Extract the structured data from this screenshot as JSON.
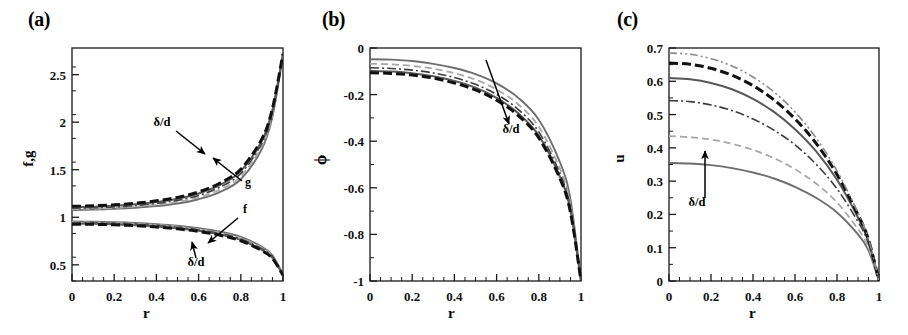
{
  "figure": {
    "panels": [
      {
        "tag": "(a)",
        "xlabel": "r",
        "ylabel": "f,g",
        "annotations": [
          "δ/d",
          "g",
          "f",
          "δ/d"
        ]
      },
      {
        "tag": "(b)",
        "xlabel": "r",
        "ylabel": "ϕ",
        "annotations": [
          "δ/d"
        ]
      },
      {
        "tag": "(c)",
        "xlabel": "r",
        "ylabel": "u",
        "annotations": [
          "δ/d"
        ]
      }
    ]
  },
  "chart_data": [
    {
      "type": "line",
      "panel": "(a)",
      "title": "",
      "xlabel": "r",
      "ylabel": "f,g",
      "xlim": [
        0,
        1
      ],
      "ylim": [
        0.33,
        2.78
      ],
      "xticks": [
        0,
        0.2,
        0.4,
        0.6,
        0.8,
        1
      ],
      "xticklabels": [
        "0",
        "0.2",
        "0.4",
        "0.6",
        "0.8",
        "1"
      ],
      "yticks": [
        0.5,
        1,
        1.5,
        2,
        2.5
      ],
      "yticklabels": [
        "0.5",
        "1",
        "1.5",
        "2",
        "2.5"
      ],
      "grid": false,
      "legend": "none",
      "x": [
        0,
        0.1,
        0.2,
        0.3,
        0.4,
        0.5,
        0.6,
        0.7,
        0.8,
        0.9,
        0.95,
        1
      ],
      "series": [
        {
          "name": "g1",
          "style": "solid-gray",
          "values": [
            1.075,
            1.08,
            1.088,
            1.1,
            1.118,
            1.145,
            1.19,
            1.265,
            1.4,
            1.72,
            2.06,
            2.7
          ]
        },
        {
          "name": "g2",
          "style": "dashed-light",
          "values": [
            1.085,
            1.09,
            1.098,
            1.112,
            1.132,
            1.162,
            1.21,
            1.29,
            1.43,
            1.75,
            2.085,
            2.705
          ]
        },
        {
          "name": "g3",
          "style": "dashdot",
          "values": [
            1.095,
            1.1,
            1.109,
            1.124,
            1.146,
            1.178,
            1.23,
            1.315,
            1.46,
            1.78,
            2.11,
            2.71
          ]
        },
        {
          "name": "g4",
          "style": "solid-dark",
          "values": [
            1.105,
            1.111,
            1.12,
            1.136,
            1.16,
            1.194,
            1.25,
            1.338,
            1.485,
            1.805,
            2.13,
            2.715
          ]
        },
        {
          "name": "g5",
          "style": "dashed-bold",
          "values": [
            1.115,
            1.121,
            1.131,
            1.148,
            1.173,
            1.209,
            1.267,
            1.358,
            1.506,
            1.825,
            2.145,
            2.72
          ]
        },
        {
          "name": "f1",
          "style": "solid-gray",
          "values": [
            0.955,
            0.953,
            0.948,
            0.94,
            0.928,
            0.911,
            0.886,
            0.85,
            0.794,
            0.69,
            0.6,
            0.4
          ]
        },
        {
          "name": "f2",
          "style": "dashed-light",
          "values": [
            0.948,
            0.946,
            0.941,
            0.932,
            0.92,
            0.902,
            0.876,
            0.839,
            0.782,
            0.678,
            0.59,
            0.398
          ]
        },
        {
          "name": "f3",
          "style": "dashdot",
          "values": [
            0.941,
            0.939,
            0.934,
            0.925,
            0.912,
            0.893,
            0.867,
            0.829,
            0.771,
            0.667,
            0.581,
            0.396
          ]
        },
        {
          "name": "f4",
          "style": "solid-dark",
          "values": [
            0.934,
            0.932,
            0.927,
            0.917,
            0.904,
            0.885,
            0.858,
            0.82,
            0.761,
            0.657,
            0.573,
            0.394
          ]
        },
        {
          "name": "f5",
          "style": "dashed-bold",
          "values": [
            0.928,
            0.926,
            0.921,
            0.911,
            0.897,
            0.878,
            0.851,
            0.812,
            0.753,
            0.649,
            0.566,
            0.392
          ]
        }
      ],
      "annotation_labels": [
        "δ/d",
        "g",
        "f",
        "δ/d"
      ]
    },
    {
      "type": "line",
      "panel": "(b)",
      "title": "",
      "xlabel": "r",
      "ylabel": "ϕ",
      "xlim": [
        0,
        1
      ],
      "ylim": [
        -1,
        0
      ],
      "xticks": [
        0,
        0.2,
        0.4,
        0.6,
        0.8,
        1
      ],
      "xticklabels": [
        "0",
        "0.2",
        "0.4",
        "0.6",
        "0.8",
        "1"
      ],
      "yticks": [
        0,
        -0.2,
        -0.4,
        -0.6,
        -0.8,
        -1
      ],
      "yticklabels": [
        "0",
        "-0.2",
        "-0.4",
        "-0.6",
        "-0.8",
        "-1"
      ],
      "grid": false,
      "legend": "none",
      "x": [
        0,
        0.1,
        0.2,
        0.3,
        0.4,
        0.5,
        0.6,
        0.7,
        0.8,
        0.9,
        0.95,
        1
      ],
      "series": [
        {
          "name": "phi1",
          "style": "solid-gray",
          "values": [
            -0.048,
            -0.05,
            -0.056,
            -0.068,
            -0.086,
            -0.112,
            -0.152,
            -0.212,
            -0.308,
            -0.49,
            -0.65,
            -1.0
          ]
        },
        {
          "name": "phi2",
          "style": "dashed-light",
          "values": [
            -0.068,
            -0.07,
            -0.077,
            -0.089,
            -0.108,
            -0.136,
            -0.178,
            -0.24,
            -0.338,
            -0.518,
            -0.672,
            -1.0
          ]
        },
        {
          "name": "phi3",
          "style": "dashdot",
          "values": [
            -0.085,
            -0.088,
            -0.095,
            -0.107,
            -0.127,
            -0.156,
            -0.199,
            -0.262,
            -0.36,
            -0.538,
            -0.688,
            -1.0
          ]
        },
        {
          "name": "phi4",
          "style": "solid-dark",
          "values": [
            -0.098,
            -0.101,
            -0.108,
            -0.121,
            -0.141,
            -0.17,
            -0.214,
            -0.278,
            -0.376,
            -0.552,
            -0.698,
            -1.0
          ]
        },
        {
          "name": "phi5",
          "style": "dashed-bold",
          "values": [
            -0.106,
            -0.109,
            -0.116,
            -0.129,
            -0.15,
            -0.18,
            -0.224,
            -0.288,
            -0.386,
            -0.56,
            -0.705,
            -1.0
          ]
        }
      ],
      "annotation_labels": [
        "δ/d"
      ]
    },
    {
      "type": "line",
      "panel": "(c)",
      "title": "",
      "xlabel": "r",
      "ylabel": "u",
      "xlim": [
        0,
        1
      ],
      "ylim": [
        0,
        0.7
      ],
      "xticks": [
        0,
        0.2,
        0.4,
        0.6,
        0.8,
        1
      ],
      "xticklabels": [
        "0",
        "0.2",
        "0.4",
        "0.6",
        "0.8",
        "1"
      ],
      "yticks": [
        0,
        0.1,
        0.2,
        0.3,
        0.4,
        0.5,
        0.6,
        0.7
      ],
      "yticklabels": [
        "0",
        "0.1",
        "0.2",
        "0.3",
        "0.4",
        "0.5",
        "0.6",
        "0.7"
      ],
      "grid": false,
      "legend": "none",
      "x": [
        0,
        0.1,
        0.2,
        0.3,
        0.4,
        0.5,
        0.6,
        0.7,
        0.8,
        0.9,
        0.95,
        1
      ],
      "series": [
        {
          "name": "u1",
          "style": "solid-gray",
          "values": [
            0.355,
            0.353,
            0.348,
            0.339,
            0.326,
            0.308,
            0.283,
            0.25,
            0.206,
            0.14,
            0.092,
            0.0
          ]
        },
        {
          "name": "u2",
          "style": "dashed-light",
          "values": [
            0.435,
            0.432,
            0.425,
            0.412,
            0.394,
            0.369,
            0.336,
            0.293,
            0.236,
            0.156,
            0.101,
            0.0
          ]
        },
        {
          "name": "u3",
          "style": "dashdot",
          "values": [
            0.542,
            0.539,
            0.529,
            0.512,
            0.487,
            0.453,
            0.409,
            0.351,
            0.277,
            0.178,
            0.113,
            0.0
          ]
        },
        {
          "name": "u4",
          "style": "solid-dark",
          "values": [
            0.61,
            0.606,
            0.595,
            0.576,
            0.547,
            0.508,
            0.456,
            0.39,
            0.304,
            0.191,
            0.12,
            0.0
          ]
        },
        {
          "name": "u5",
          "style": "dashed-bold",
          "values": [
            0.655,
            0.651,
            0.639,
            0.618,
            0.587,
            0.544,
            0.487,
            0.414,
            0.32,
            0.199,
            0.124,
            0.0
          ]
        },
        {
          "name": "u6",
          "style": "dashdotdot-light",
          "values": [
            0.685,
            0.681,
            0.668,
            0.646,
            0.613,
            0.568,
            0.508,
            0.43,
            0.331,
            0.205,
            0.127,
            0.0
          ]
        }
      ],
      "annotation_labels": [
        "δ/d"
      ]
    }
  ]
}
